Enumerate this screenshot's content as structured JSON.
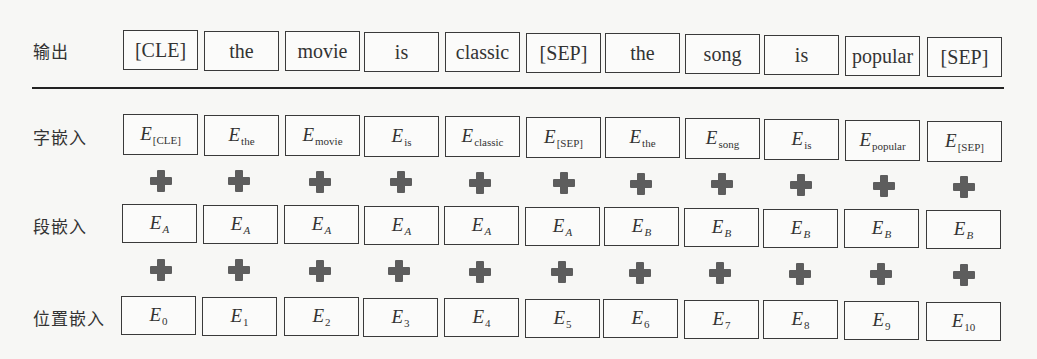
{
  "labels": {
    "output": "输出",
    "token": "字嵌入",
    "segment": "段嵌入",
    "position": "位置嵌入"
  },
  "output_tokens": [
    "[CLE]",
    "the",
    "movie",
    "is",
    "classic",
    "[SEP]",
    "the",
    "song",
    "is",
    "popular",
    "[SEP]"
  ],
  "token_embeddings": [
    {
      "base": "E",
      "sub": "[CLE]"
    },
    {
      "base": "E",
      "sub": "the"
    },
    {
      "base": "E",
      "sub": "movie"
    },
    {
      "base": "E",
      "sub": "is"
    },
    {
      "base": "E",
      "sub": "classic"
    },
    {
      "base": "E",
      "sub": "[SEP]"
    },
    {
      "base": "E",
      "sub": "the"
    },
    {
      "base": "E",
      "sub": "song"
    },
    {
      "base": "E",
      "sub": "is"
    },
    {
      "base": "E",
      "sub": "popular"
    },
    {
      "base": "E",
      "sub": "[SEP]"
    }
  ],
  "segment_embeddings": [
    {
      "base": "E",
      "sub": "A"
    },
    {
      "base": "E",
      "sub": "A"
    },
    {
      "base": "E",
      "sub": "A"
    },
    {
      "base": "E",
      "sub": "A"
    },
    {
      "base": "E",
      "sub": "A"
    },
    {
      "base": "E",
      "sub": "A"
    },
    {
      "base": "E",
      "sub": "B"
    },
    {
      "base": "E",
      "sub": "B"
    },
    {
      "base": "E",
      "sub": "B"
    },
    {
      "base": "E",
      "sub": "B"
    },
    {
      "base": "E",
      "sub": "B"
    }
  ],
  "position_embeddings": [
    {
      "base": "E",
      "sub": "0"
    },
    {
      "base": "E",
      "sub": "1"
    },
    {
      "base": "E",
      "sub": "2"
    },
    {
      "base": "E",
      "sub": "3"
    },
    {
      "base": "E",
      "sub": "4"
    },
    {
      "base": "E",
      "sub": "5"
    },
    {
      "base": "E",
      "sub": "6"
    },
    {
      "base": "E",
      "sub": "7"
    },
    {
      "base": "E",
      "sub": "8"
    },
    {
      "base": "E",
      "sub": "9"
    },
    {
      "base": "E",
      "sub": "10"
    }
  ],
  "operator_icon": "plus-icon",
  "colors": {
    "box_border": "#3a3a3a",
    "plus": "#5d5d5d",
    "background": "#f7f7f5"
  }
}
